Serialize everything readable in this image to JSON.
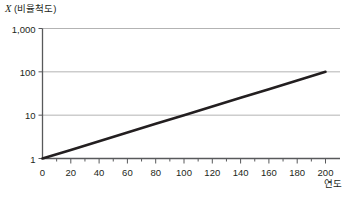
{
  "chart_data": {
    "type": "line",
    "title": "",
    "ylabel": "X (비율척도)",
    "ylabel_symbol": "X",
    "ylabel_paren": "(비율척도)",
    "xlabel": "연도",
    "yscale": "log",
    "xscale": "linear",
    "xlim": [
      0,
      210
    ],
    "ylim": [
      1,
      1000
    ],
    "grid": "horizontal",
    "legend": "none",
    "y_ticks": [
      {
        "value": 1000,
        "label": "1,000"
      },
      {
        "value": 100,
        "label": "100"
      },
      {
        "value": 10,
        "label": "10"
      },
      {
        "value": 1,
        "label": "1"
      }
    ],
    "x_ticks": [
      {
        "value": 0,
        "label": "0"
      },
      {
        "value": 20,
        "label": "20"
      },
      {
        "value": 40,
        "label": "40"
      },
      {
        "value": 60,
        "label": "60"
      },
      {
        "value": 80,
        "label": "80"
      },
      {
        "value": 100,
        "label": "100"
      },
      {
        "value": 120,
        "label": "120"
      },
      {
        "value": 140,
        "label": "140"
      },
      {
        "value": 160,
        "label": "160"
      },
      {
        "value": 180,
        "label": "180"
      },
      {
        "value": 200,
        "label": "200"
      }
    ],
    "x_minor_ticks": [
      10,
      30,
      50,
      70,
      90,
      110,
      130,
      150,
      170,
      190
    ],
    "series": [
      {
        "name": "exponential-growth",
        "color": "#231f20",
        "linewidth": 2.6,
        "x": [
          0,
          20,
          40,
          60,
          80,
          100,
          120,
          140,
          160,
          180,
          200
        ],
        "values": [
          1,
          1.58,
          2.51,
          3.98,
          6.31,
          10,
          15.8,
          25.1,
          39.8,
          63.1,
          100
        ]
      }
    ],
    "colors": {
      "line": "#231f20",
      "grid": "#b3b3b3",
      "axis": "#58595b",
      "text": "#231f20",
      "background": "#ffffff"
    }
  }
}
